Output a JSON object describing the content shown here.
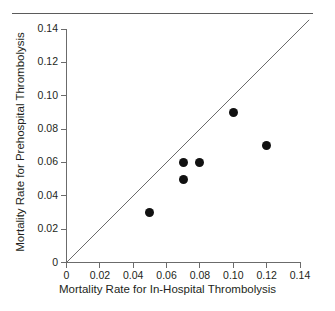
{
  "figure": {
    "name": "scatter-plot-mortality-rates",
    "has_top_rule": true,
    "background": "#ffffff",
    "point_color": "#111111",
    "axis_color": "#6b6b6b",
    "text_color": "#231f20"
  },
  "chart_data": {
    "type": "scatter",
    "title": "",
    "subtitle": "",
    "xlabel": "Mortality Rate for In-Hospital Thrombolysis",
    "ylabel": "Mortality Rate for Prehospital Thrombolysis",
    "xlim": [
      0,
      0.14
    ],
    "ylim": [
      0,
      0.14
    ],
    "xticks": [
      0,
      0.02,
      0.04,
      0.06,
      0.08,
      0.1,
      0.12,
      0.14
    ],
    "yticks": [
      0,
      0.02,
      0.04,
      0.06,
      0.08,
      0.1,
      0.12,
      0.14
    ],
    "xticklabels": [
      "0",
      "0.02",
      "0.04",
      "0.06",
      "0.08",
      "0.10",
      "0.12",
      "0.14"
    ],
    "yticklabels": [
      "0",
      "0.02",
      "0.04",
      "0.06",
      "0.08",
      "0.10",
      "0.12",
      "0.14"
    ],
    "grid": false,
    "legend": null,
    "legend_position": "none",
    "points": [
      {
        "x": 0.05,
        "y": 0.03
      },
      {
        "x": 0.07,
        "y": 0.06
      },
      {
        "x": 0.07,
        "y": 0.05
      },
      {
        "x": 0.08,
        "y": 0.06
      },
      {
        "x": 0.1,
        "y": 0.09
      },
      {
        "x": 0.12,
        "y": 0.07
      }
    ],
    "reference_line": {
      "name": "line-of-identity",
      "type": "identity",
      "slope": 1,
      "intercept": 0,
      "from": {
        "x": 0.0,
        "y": 0.0
      },
      "to": {
        "x": 0.1455,
        "y": 0.1455
      },
      "annotation": ""
    },
    "annotations": []
  }
}
